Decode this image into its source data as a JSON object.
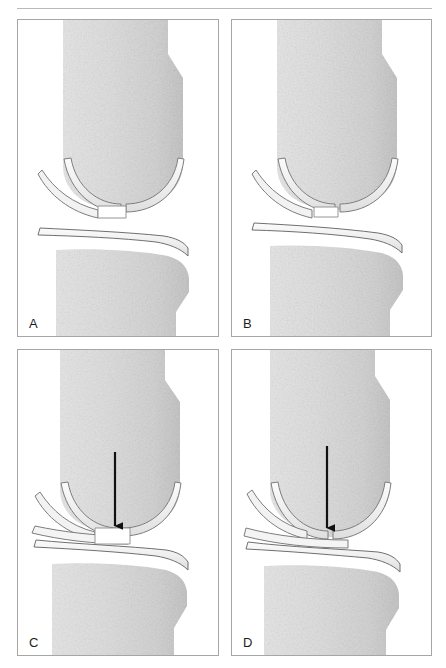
{
  "figure": {
    "type": "medical-illustration",
    "panel_count": 4,
    "background_color": "#ffffff",
    "rule_color": "#b9b9b9"
  },
  "palette": {
    "bone_fill": "#d9d9d9",
    "bone_fill_light": "#e8e8e8",
    "bone_fill_dark": "#c2c2c2",
    "bone_outline": "#8e8e8e",
    "cartilage_fill": "#ededed",
    "cartilage_fill_light": "#f7f7f7",
    "cartilage_outline": "#7a7a7a",
    "defect_fill": "#ffffff",
    "arrow_color": "#111111",
    "panel_border": "#a6a6a6",
    "label_color": "#1d1d1d"
  },
  "panels": [
    {
      "id": "a",
      "label": "A",
      "caption": "Normal joint space with intact cartilage on femur and tibia",
      "joint_space_state": "normal",
      "joint_gap_px": 22,
      "has_arrow": false,
      "has_defect": true,
      "defect_label": "cartilage notch"
    },
    {
      "id": "b",
      "label": "B",
      "caption": "Mildly reduced joint space, cartilage still present",
      "joint_space_state": "mildly-narrowed",
      "joint_gap_px": 16,
      "has_arrow": false,
      "has_defect": true,
      "defect_label": "cartilage notch"
    },
    {
      "id": "c",
      "label": "C",
      "caption": "Markedly narrowed joint space; arrow indicates focal cartilage defect",
      "joint_space_state": "narrowed",
      "joint_gap_px": 8,
      "has_arrow": true,
      "has_defect": true,
      "defect_label": "focal cartilage defect"
    },
    {
      "id": "d",
      "label": "D",
      "caption": "Complete joint space loss; arrow indicates bone-on-bone contact",
      "joint_space_state": "obliterated",
      "joint_gap_px": 2,
      "has_arrow": true,
      "has_defect": false,
      "defect_label": "bone-on-bone contact"
    }
  ],
  "structures": {
    "femur": "femur-bone",
    "tibia": "tibia-bone",
    "femoral_cartilage": "femoral-cartilage",
    "tibial_cartilage": "tibial-cartilage",
    "meniscus": "meniscus"
  }
}
